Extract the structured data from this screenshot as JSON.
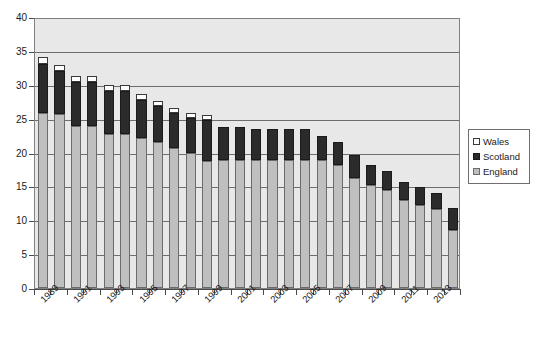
{
  "chart_data": {
    "type": "bar",
    "stacked": true,
    "title": "",
    "subtitle": "",
    "xlabel": "",
    "ylabel": "",
    "ylim": [
      0,
      40
    ],
    "ytick_step": 5,
    "yticks": [
      "0",
      "5",
      "10",
      "15",
      "20",
      "25",
      "30",
      "35",
      "40"
    ],
    "grid": true,
    "grid_axis": "y",
    "legend_position": "right",
    "categories": [
      "1989",
      "1990",
      "1991",
      "1992",
      "1993",
      "1994",
      "1995",
      "1996",
      "1997",
      "1998",
      "1999",
      "2000",
      "2001",
      "2002",
      "2003",
      "2004",
      "2005",
      "2006",
      "2007",
      "2008",
      "2009",
      "2010",
      "2011",
      "2012",
      "2013",
      "2014"
    ],
    "xtick_labels": [
      "1989",
      "1991",
      "1993",
      "1995",
      "1997",
      "1999",
      "2001",
      "2003",
      "2005",
      "2007",
      "2009",
      "2011",
      "2013"
    ],
    "series": [
      {
        "name": "England",
        "color": "#bfbfbf",
        "values": [
          25.9,
          25.7,
          23.9,
          23.9,
          22.8,
          22.8,
          22.2,
          21.6,
          20.6,
          20.0,
          18.7,
          18.9,
          18.9,
          18.9,
          18.9,
          18.9,
          18.9,
          18.9,
          18.1,
          16.3,
          15.2,
          14.4,
          13.0,
          12.3,
          11.6,
          8.6
        ]
      },
      {
        "name": "Scotland",
        "color": "#2b2b2b",
        "values": [
          7.2,
          6.3,
          6.5,
          6.5,
          6.3,
          6.3,
          5.6,
          5.2,
          5.3,
          5.1,
          6.1,
          4.9,
          4.9,
          4.5,
          4.5,
          4.5,
          4.5,
          3.6,
          3.4,
          3.4,
          3.0,
          2.8,
          2.7,
          2.6,
          2.4,
          3.2
        ]
      },
      {
        "name": "Wales",
        "color": "#ffffff",
        "values": [
          1.0,
          0.9,
          0.9,
          0.9,
          0.9,
          0.9,
          0.9,
          0.8,
          0.7,
          0.7,
          0.7,
          0.0,
          0.0,
          0.0,
          0.0,
          0.0,
          0.0,
          0.0,
          0.0,
          0.0,
          0.0,
          0.0,
          0.0,
          0.0,
          0.0,
          0.0
        ]
      }
    ],
    "totals": [
      34.1,
      32.9,
      31.3,
      31.3,
      30.0,
      30.0,
      28.7,
      27.6,
      26.6,
      25.8,
      25.5,
      23.8,
      23.8,
      23.4,
      23.4,
      23.4,
      23.4,
      22.5,
      21.5,
      19.7,
      18.2,
      17.2,
      15.7,
      14.9,
      14.0,
      11.8
    ]
  },
  "legend": {
    "items": [
      {
        "label": "Wales",
        "swatch": "wales-swatch"
      },
      {
        "label": "Scotland",
        "swatch": "scotland-swatch"
      },
      {
        "label": "England",
        "swatch": "england-swatch"
      }
    ]
  }
}
